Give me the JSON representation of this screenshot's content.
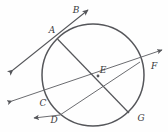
{
  "figure": {
    "type": "circle-geometry-diagram",
    "background_color": "#fefefe",
    "stroke_color": "#55565a",
    "label_color": "#3a3a3c"
  },
  "circle": {
    "name": "main-circle",
    "cx": 93,
    "cy": 75,
    "r": 51,
    "stroke_width": 1.5
  },
  "points": [
    {
      "id": "A",
      "label": "A",
      "x": 57.5,
      "y": 39.0,
      "label_x": 52,
      "label_y": 33
    },
    {
      "id": "B",
      "label": "B",
      "x": 80.0,
      "y": 16.0,
      "label_x": 76,
      "label_y": 13
    },
    {
      "id": "C",
      "label": "C",
      "x": 51.0,
      "y": 104.0,
      "label_x": 43,
      "label_y": 105
    },
    {
      "id": "D",
      "label": "D",
      "x": 60.0,
      "y": 115.0,
      "label_x": 54,
      "label_y": 122
    },
    {
      "id": "E",
      "label": "E",
      "x": 98.0,
      "y": 76.0,
      "label_x": 100,
      "label_y": 73
    },
    {
      "id": "F",
      "label": "F",
      "x": 140.0,
      "y": 62.0,
      "label_x": 152,
      "label_y": 68
    },
    {
      "id": "G",
      "label": "G",
      "x": 129.0,
      "y": 113.0,
      "label_x": 139,
      "label_y": 120
    }
  ],
  "segments": [
    {
      "name": "chord-A-G",
      "from": "A",
      "to": "G",
      "kind": "chord"
    },
    {
      "name": "chord-D-F",
      "from": "D",
      "to": "F",
      "kind": "chord"
    }
  ],
  "rays": [
    {
      "name": "ray-A-to-B",
      "from_x": 57.5,
      "from_y": 39.0,
      "to_x": 88.0,
      "to_y": 10.0,
      "arrow": true
    },
    {
      "name": "ray-A-to-lower-left",
      "from_x": 57.5,
      "from_y": 39.0,
      "to_x": 13.0,
      "to_y": 70.0,
      "arrow": true
    },
    {
      "name": "ray-F-to-upper-right",
      "from_x": 140.0,
      "from_y": 62.0,
      "to_x": 162.0,
      "to_y": 50.0,
      "arrow": true
    },
    {
      "name": "ray-C-to-left",
      "from_x": 51.0,
      "from_y": 104.0,
      "to_x": 12.0,
      "to_y": 101.0,
      "arrow": true
    },
    {
      "name": "ray-D-to-lower-left",
      "from_x": 60.0,
      "from_y": 115.0,
      "to_x": 34.0,
      "to_y": 118.0,
      "arrow": true
    }
  ],
  "lines": [
    {
      "name": "secant-through-C-and-F",
      "x1": 12.0,
      "y1": 101.0,
      "x2": 162.0,
      "y2": 50.0
    },
    {
      "name": "secant-through-A-and-B",
      "x1": 13.0,
      "y1": 70.0,
      "x2": 88.0,
      "y2": 10.0
    }
  ]
}
